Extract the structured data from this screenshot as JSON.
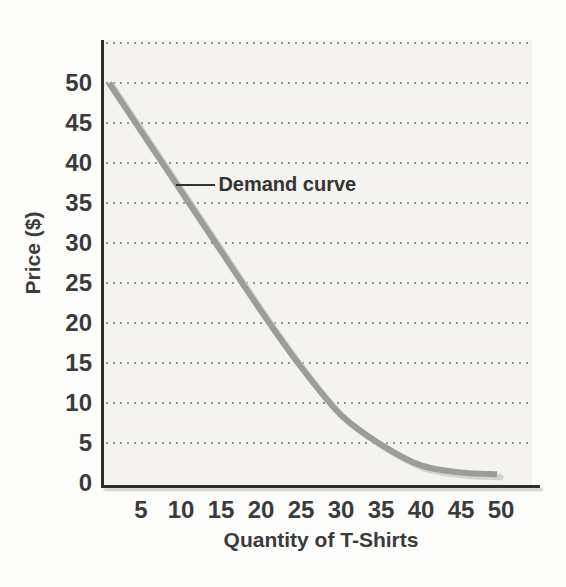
{
  "chart_data": {
    "type": "line",
    "title": "",
    "xlabel": "Quantity of T-Shirts",
    "ylabel": "Price ($)",
    "x_ticks": [
      5,
      10,
      15,
      20,
      25,
      30,
      35,
      40,
      45,
      50
    ],
    "y_ticks": [
      0,
      5,
      10,
      15,
      20,
      25,
      30,
      35,
      40,
      45,
      50
    ],
    "xlim": [
      0,
      53.8
    ],
    "ylim": [
      0,
      55.9
    ],
    "grid": "horizontal dotted lines, one per 5-unit step including one above top tick",
    "gridline_values": [
      5,
      10,
      15,
      20,
      25,
      30,
      35,
      40,
      45,
      50,
      55
    ],
    "legend": "none",
    "series": [
      {
        "name": "Demand curve",
        "points": [
          [
            1,
            50
          ],
          [
            5,
            44
          ],
          [
            10,
            36.5
          ],
          [
            15,
            29
          ],
          [
            20,
            21.5
          ],
          [
            25,
            14.5
          ],
          [
            30,
            8.5
          ],
          [
            35,
            4.8
          ],
          [
            40,
            2.2
          ],
          [
            45,
            1.3
          ],
          [
            49.5,
            1.1
          ]
        ]
      }
    ],
    "annotation": {
      "label": "Demand curve",
      "pointer_from": [
        14.3,
        37.2
      ],
      "pointer_to": [
        9.4,
        37.2
      ]
    },
    "colors": {
      "curve": "#9c9c9c",
      "curve_shadow": "#d2d2cf",
      "axis": "#2f2f2f",
      "text": "#3b3b3b",
      "grid_dot": "#979795",
      "plot_bg": "#f4f3ef",
      "page_bg": "#fdfdfc"
    }
  }
}
